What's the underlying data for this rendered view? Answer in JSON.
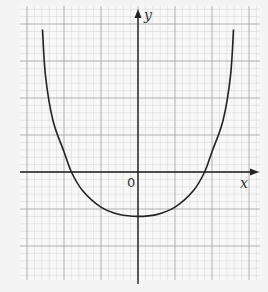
{
  "chart_data": {
    "type": "line",
    "title": "",
    "xlabel": "x",
    "ylabel": "y",
    "origin_label": "0",
    "grid": true,
    "legend": null,
    "axis_ticks_labeled": false,
    "xlim": [
      -3.2,
      3.3
    ],
    "ylim": [
      -2.9,
      4.5
    ],
    "series": [
      {
        "name": "curve",
        "x": [
          -2.58,
          -2.5,
          -2.3,
          -2.0,
          -1.8,
          -1.5,
          -1.0,
          -0.5,
          0.0,
          0.5,
          1.0,
          1.5,
          1.8,
          2.0,
          2.3,
          2.5,
          2.58
        ],
        "y": [
          3.85,
          2.6,
          1.4,
          0.55,
          0.0,
          -0.5,
          -0.95,
          -1.15,
          -1.2,
          -1.15,
          -0.95,
          -0.5,
          0.0,
          0.55,
          1.4,
          2.6,
          3.85
        ]
      }
    ],
    "key_points": {
      "x_intercepts": [
        -1.8,
        1.8
      ],
      "y_intercept": -1.2,
      "minimum": [
        0,
        -1.2
      ]
    }
  },
  "colors": {
    "background": "#f4f4f4",
    "grid_paper": "#f8f8f8",
    "minor_grid": "#d6d6d6",
    "major_grid": "#a8a8a8",
    "axis": "#222222",
    "curve": "#222222"
  }
}
